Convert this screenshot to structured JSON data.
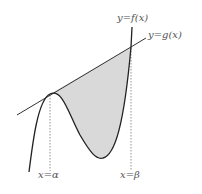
{
  "diagram": {
    "labels": {
      "f_curve": "y=f(x)",
      "g_line": "y=g(x)",
      "alpha": "x=α",
      "beta": "x=β"
    },
    "colors": {
      "curve": "#222222",
      "line": "#333333",
      "fill": "#d9d9d9",
      "dashed": "#888888",
      "label": "#555555"
    },
    "geometry": {
      "tangent_point_alpha": [
        50,
        94
      ],
      "intersection_beta": [
        131,
        47
      ],
      "local_min": [
        101,
        158
      ],
      "curve_start": [
        29,
        172
      ],
      "curve_end": [
        131,
        27
      ],
      "tangent_line": [
        [
          17,
          115
        ],
        [
          146,
          38
        ]
      ]
    },
    "shaded_region": "area between y=f(x) and y=g(x) from x=α to x=β"
  }
}
